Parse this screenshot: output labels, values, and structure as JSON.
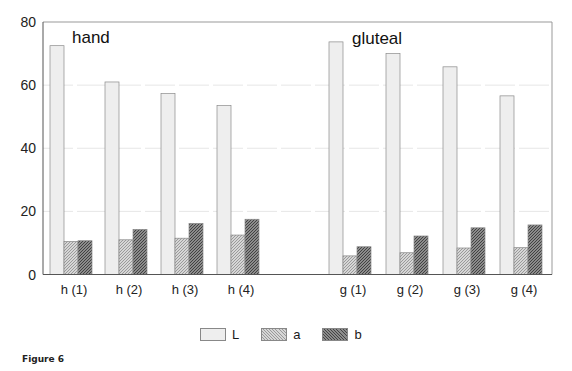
{
  "figure": {
    "label": "Figure 6"
  },
  "chart_data": {
    "type": "bar",
    "title": "",
    "xlabel": "",
    "ylabel": "",
    "ylim": [
      0,
      80
    ],
    "yticks": [
      0,
      20,
      40,
      60,
      80
    ],
    "grid": true,
    "legend_position": "bottom",
    "annotations": [
      {
        "text": "hand",
        "group": "hand"
      },
      {
        "text": "gluteal",
        "group": "gluteal"
      }
    ],
    "categories": [
      "h (1)",
      "h (2)",
      "h (3)",
      "h (4)",
      "g (1)",
      "g (2)",
      "g (3)",
      "g (4)"
    ],
    "series": [
      {
        "name": "L",
        "values": [
          72.5,
          61,
          57.3,
          53.5,
          73.7,
          70,
          65.8,
          56.6
        ],
        "color": "#eeeeee"
      },
      {
        "name": "a",
        "values": [
          10.5,
          11,
          11.5,
          12.5,
          5.9,
          6.9,
          8.4,
          8.5
        ],
        "color": "#bdbdbd"
      },
      {
        "name": "b",
        "values": [
          10.7,
          14.3,
          16.2,
          17.5,
          8.8,
          12.2,
          14.8,
          15.7
        ],
        "color": "#777777"
      }
    ]
  },
  "legend": [
    {
      "label": "L",
      "color": "#eeeeee",
      "pattern": "plain"
    },
    {
      "label": "a",
      "color": "#bdbdbd",
      "pattern": "hatch-light"
    },
    {
      "label": "b",
      "color": "#777777",
      "pattern": "hatch-dark"
    }
  ]
}
